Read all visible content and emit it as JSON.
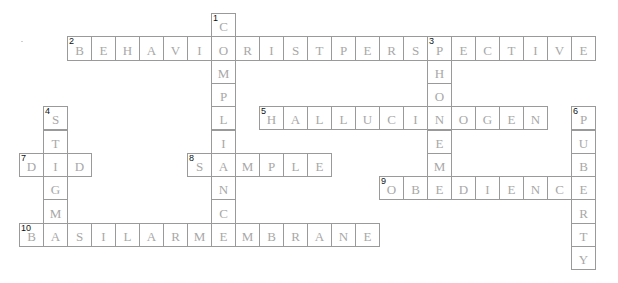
{
  "puzzle": {
    "type": "crossword",
    "cell_width": 24,
    "cell_height": 23.3,
    "origin_x": 19,
    "origin_y": 13,
    "colors": {
      "border": "#9a9a9a",
      "letter": "#a8a8a8",
      "number": "#111111",
      "background": "#ffffff"
    },
    "entries": [
      {
        "number": "1",
        "direction": "down",
        "answer": "COMPLIANCE",
        "row": 0,
        "col": 8
      },
      {
        "number": "2",
        "direction": "across",
        "answer": "BEHAVIORISTPERSPECTIVE",
        "row": 1,
        "col": 2
      },
      {
        "number": "3",
        "direction": "down",
        "answer": "PHONEME",
        "row": 1,
        "col": 17
      },
      {
        "number": "4",
        "direction": "down",
        "answer": "STIGMA",
        "row": 4,
        "col": 1
      },
      {
        "number": "5",
        "direction": "across",
        "answer": "HALLUCINOGEN",
        "row": 4,
        "col": 10
      },
      {
        "number": "6",
        "direction": "down",
        "answer": "PUBERTY",
        "row": 4,
        "col": 23
      },
      {
        "number": "7",
        "direction": "across",
        "answer": "DID",
        "row": 6,
        "col": 0
      },
      {
        "number": "8",
        "direction": "across",
        "answer": "SAMPLE",
        "row": 6,
        "col": 7
      },
      {
        "number": "9",
        "direction": "across",
        "answer": "OBEDIENCE",
        "row": 7,
        "col": 15
      },
      {
        "number": "10",
        "direction": "across",
        "answer": "BASILARMEMBRANE",
        "row": 9,
        "col": 0
      }
    ]
  }
}
